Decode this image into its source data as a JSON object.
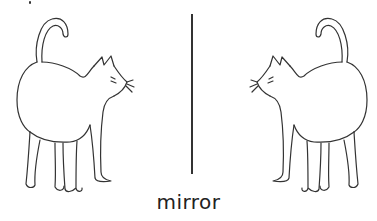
{
  "figure": {
    "caption": "mirror",
    "left_image": "cat facing right",
    "right_image": "cat facing left (mirror image)",
    "line_color": "#333333"
  }
}
